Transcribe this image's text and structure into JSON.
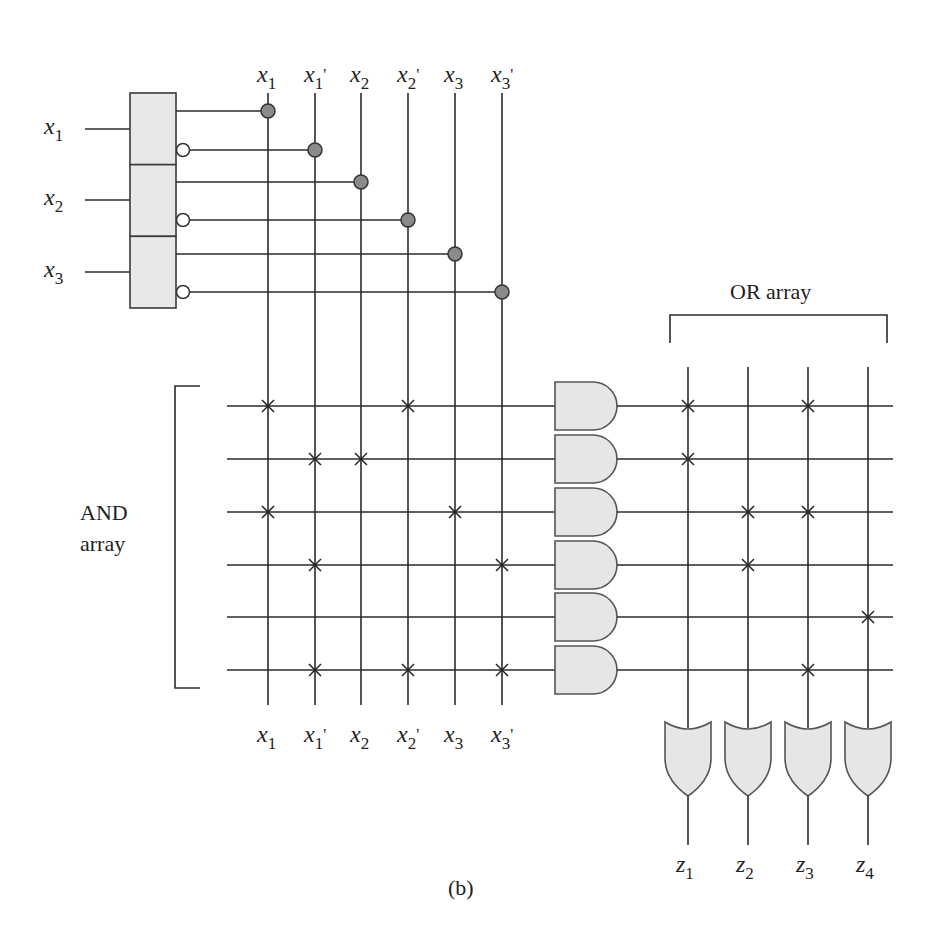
{
  "figure": {
    "caption": "(b)",
    "and_array_label": [
      "AND",
      "array"
    ],
    "or_array_label": "OR array"
  },
  "inputs": [
    {
      "name": "x",
      "sub": "1",
      "y": 129
    },
    {
      "name": "x",
      "sub": "2",
      "y": 200
    },
    {
      "name": "x",
      "sub": "3",
      "y": 272
    }
  ],
  "literal_columns": [
    {
      "name": "x",
      "sub": "1",
      "prime": false,
      "x": 268,
      "source_y": 111,
      "inverted": false
    },
    {
      "name": "x",
      "sub": "1",
      "prime": true,
      "x": 315,
      "source_y": 150,
      "inverted": true
    },
    {
      "name": "x",
      "sub": "2",
      "prime": false,
      "x": 361,
      "source_y": 182,
      "inverted": false
    },
    {
      "name": "x",
      "sub": "2",
      "prime": true,
      "x": 408,
      "source_y": 220,
      "inverted": true
    },
    {
      "name": "x",
      "sub": "3",
      "prime": false,
      "x": 455,
      "source_y": 254,
      "inverted": false
    },
    {
      "name": "x",
      "sub": "3",
      "prime": true,
      "x": 502,
      "source_y": 292,
      "inverted": true
    }
  ],
  "product_terms": [
    {
      "y": 406,
      "and_connections": [
        0,
        3
      ],
      "or_connections": [
        0,
        2
      ]
    },
    {
      "y": 459,
      "and_connections": [
        1,
        2
      ],
      "or_connections": [
        0
      ]
    },
    {
      "y": 512,
      "and_connections": [
        0,
        4
      ],
      "or_connections": [
        1,
        2
      ]
    },
    {
      "y": 565,
      "and_connections": [
        1,
        5
      ],
      "or_connections": [
        1
      ]
    },
    {
      "y": 617,
      "and_connections": [],
      "or_connections": [
        3
      ]
    },
    {
      "y": 670,
      "and_connections": [
        1,
        3,
        5
      ],
      "or_connections": [
        2
      ]
    }
  ],
  "outputs": [
    {
      "name": "z",
      "sub": "1",
      "x": 688
    },
    {
      "name": "z",
      "sub": "2",
      "x": 748
    },
    {
      "name": "z",
      "sub": "3",
      "x": 808
    },
    {
      "name": "z",
      "sub": "4",
      "x": 868
    }
  ],
  "colors": {
    "line": "#2b2b2b",
    "gate_fill": "#e6e6e6",
    "dot_fill": "#8a8a8a",
    "background": "#ffffff"
  }
}
